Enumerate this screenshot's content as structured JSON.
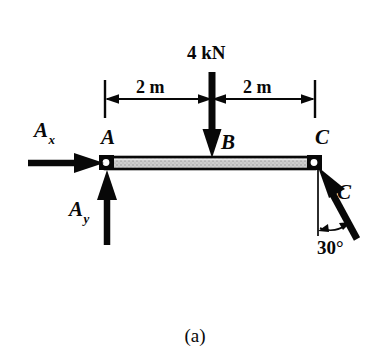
{
  "figure": {
    "caption": "(a)",
    "type": "free-body-diagram"
  },
  "colors": {
    "ink": "#080808",
    "beam_fill": "#c9c9c9",
    "background": "#ffffff"
  },
  "labels": {
    "reaction_x": {
      "base": "A",
      "subscript": "x"
    },
    "reaction_y": {
      "base": "A",
      "subscript": "y"
    },
    "point_a": "A",
    "point_b": "B",
    "point_c": "C",
    "force_c": "C",
    "applied_load": "4 kN",
    "angle": "30°"
  },
  "dimensions": [
    {
      "name": "left-span",
      "text": "2 m",
      "from": "A",
      "to": "B"
    },
    {
      "name": "right-span",
      "text": "2 m",
      "from": "B",
      "to": "C"
    }
  ],
  "geometry": {
    "beam": {
      "x1": 105,
      "x2": 315,
      "y_top": 157,
      "y_bottom": 169
    },
    "pin_a": {
      "cx": 106,
      "cy": 163,
      "r": 4
    },
    "pin_c": {
      "cx": 314,
      "cy": 163,
      "r": 4
    },
    "load_arrow": {
      "x": 212,
      "y_start": 72,
      "y_end": 157
    },
    "reaction_x_arrow": {
      "y": 163,
      "x_start": 28,
      "x_end": 104
    },
    "reaction_y_arrow": {
      "x": 107,
      "y_start": 245,
      "y_end": 170
    },
    "force_c_arrow": {
      "x_start": 356,
      "y_start": 238,
      "x_end": 318,
      "y_end": 168
    },
    "dimension_line_y": 99,
    "angle_reference": {
      "x": 318,
      "y_start": 170,
      "y_end": 236
    }
  }
}
